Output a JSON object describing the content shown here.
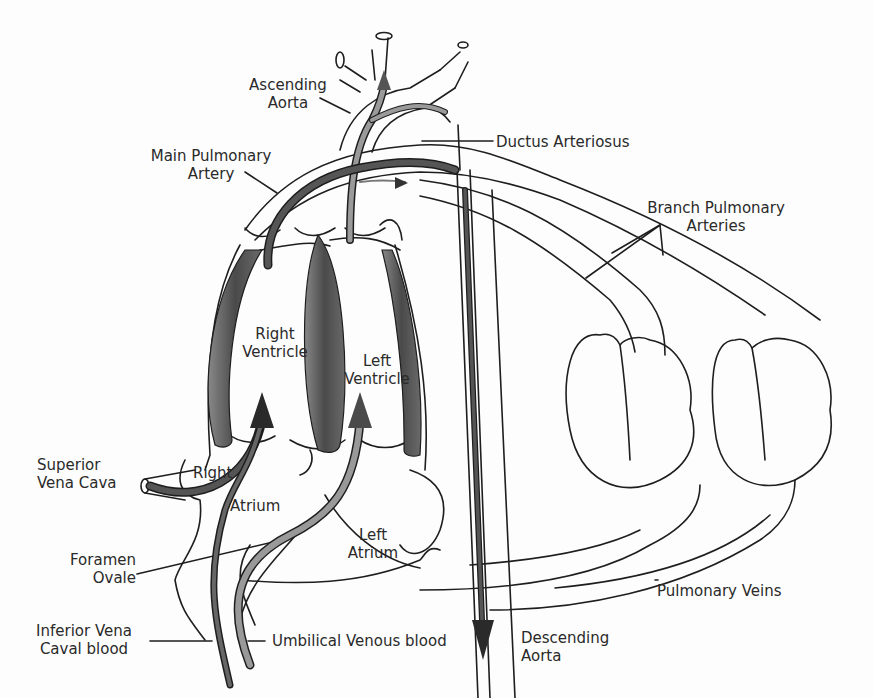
{
  "diagram": {
    "colors": {
      "outline": "#1e1e1e",
      "muscle": "#555555",
      "oxygenated_flow": "#8a8a8a",
      "deoxygenated_flow": "#3c3c3c",
      "background": "#fdfdfd"
    },
    "labels": {
      "ascending_aorta": [
        "Ascending",
        "Aorta"
      ],
      "main_pulmonary_artery": [
        "Main Pulmonary",
        "Artery"
      ],
      "ductus_arteriosus": "Ductus Arteriosus",
      "branch_pulmonary_arteries": [
        "Branch Pulmonary",
        "Arteries"
      ],
      "right_ventricle": [
        "Right",
        "Ventricle"
      ],
      "left_ventricle": [
        "Left",
        "Ventricle"
      ],
      "superior_vena_cava": [
        "Superior",
        "Vena  Cava"
      ],
      "right_atrium": [
        "Right",
        "Atrium"
      ],
      "left_atrium": [
        "Left",
        "Atrium"
      ],
      "foramen_ovale": [
        "Foramen",
        "Ovale"
      ],
      "inferior_vena_caval_blood": [
        "Inferior Vena",
        "Caval blood"
      ],
      "umbilical_venous_blood": "Umbilical Venous blood",
      "descending_aorta": [
        "Descending",
        "Aorta"
      ],
      "pulmonary_veins": "Pulmonary Veins"
    }
  }
}
